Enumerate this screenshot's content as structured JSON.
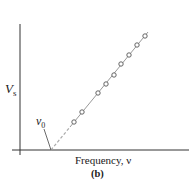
{
  "chart_data": {
    "type": "scatter",
    "title": "",
    "panel_label": "(b)",
    "xlabel": "Frequency, ν",
    "ylabel": "V",
    "ylabel_subscript": "s",
    "annotation": {
      "text": "ν",
      "subscript": "0",
      "meaning": "threshold frequency (x-intercept)"
    },
    "grid": false,
    "legend": null,
    "axes_ticks": "none",
    "series": [
      {
        "name": "measured points",
        "marker": "open-circle",
        "points_px": [
          [
            74,
            122
          ],
          [
            82,
            112
          ],
          [
            98,
            93
          ],
          [
            106,
            84
          ],
          [
            114,
            75
          ],
          [
            121,
            64
          ],
          [
            129,
            55
          ],
          [
            137,
            45
          ],
          [
            145,
            36
          ]
        ]
      }
    ],
    "fit_line": {
      "style": "solid",
      "from_px": [
        70,
        127
      ],
      "to_px": [
        148,
        32
      ]
    },
    "extrapolation": {
      "style": "dashed",
      "from_px": [
        51,
        150
      ],
      "to_px": [
        70,
        127
      ]
    },
    "axes_px": {
      "origin": [
        20,
        150
      ],
      "x_end": 189,
      "y_top": 24
    },
    "colors": {
      "axis": "#333333",
      "line": "#999999",
      "marker": "#555555",
      "text": "#1a1a1a"
    }
  }
}
